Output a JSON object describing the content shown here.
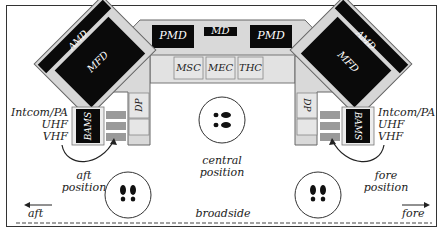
{
  "diagram": {
    "center_console": {
      "top_displays": [
        {
          "label": "PMD"
        },
        {
          "label": "MD"
        },
        {
          "label": "PMD"
        }
      ],
      "panels": [
        {
          "label": "MSC"
        },
        {
          "label": "MEC"
        },
        {
          "label": "THC"
        }
      ]
    },
    "left_wing": {
      "amd_label": "AMD",
      "mfd_label": "MFD",
      "dp_label": "DP",
      "bams_label": "BAMS",
      "comm_labels": [
        "Intcom/PA",
        "UHF",
        "VHF"
      ]
    },
    "right_wing": {
      "amd_label": "AMD",
      "mfd_label": "MFD",
      "dp_label": "DP",
      "bams_label": "BAMS",
      "comm_labels": [
        "Intcom/PA",
        "UHF",
        "VHF"
      ]
    },
    "positions": [
      {
        "line1": "aft",
        "line2": "position"
      },
      {
        "line1": "central",
        "line2": "position"
      },
      {
        "line1": "fore",
        "line2": "position"
      }
    ],
    "directions": {
      "aft": "aft",
      "fore": "fore",
      "broadside": "broadside"
    },
    "colors": {
      "console_fill": "#d9d9d9",
      "console_stroke": "#555555",
      "display_fill": "#0a0a0a",
      "panel_fill": "#e6e6e6",
      "button_fill": "#9a9a9a",
      "text_dark": "#222222",
      "text_light": "#ffffff"
    }
  }
}
